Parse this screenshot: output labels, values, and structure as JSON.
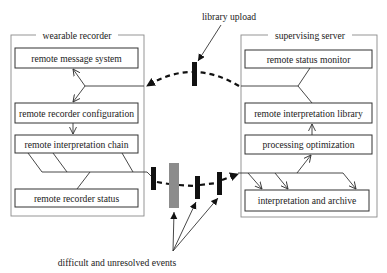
{
  "diagram": {
    "left_group": {
      "title": "wearable recorder",
      "boxes": [
        "remote message system",
        "remote recorder configuration",
        "remote interpretation chain",
        "remote recorder status"
      ]
    },
    "right_group": {
      "title": "supervising server",
      "boxes": [
        "remote status monitor",
        "remote interpretation library",
        "processing optimization",
        "interpretation and archive"
      ]
    },
    "annotations": {
      "library_upload": "library upload",
      "events": "difficult and unresolved events"
    },
    "colors": {
      "line": "#333333",
      "bar": "#111111",
      "unresolved_bar": "#8c8c8c",
      "group_border": "#8a8a8a"
    }
  }
}
